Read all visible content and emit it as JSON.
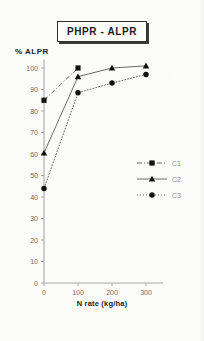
{
  "figure": {
    "background_color": "#fbfbfa",
    "title_box_border_color": "#2f2f2f"
  },
  "chart_data": {
    "type": "line",
    "title": "PHPR - ALPR",
    "xlabel": "N rate (kg/ha)",
    "ylabel": "% ALPR",
    "x": [
      0,
      100,
      200,
      300
    ],
    "xlim": [
      0,
      330
    ],
    "ylim": [
      0,
      105
    ],
    "xticks": [
      0,
      100,
      200,
      300
    ],
    "xtick_labels": [
      "0",
      "100",
      "200",
      "300"
    ],
    "yticks": [
      0,
      10,
      20,
      30,
      40,
      50,
      60,
      70,
      80,
      90,
      100
    ],
    "ytick_labels": [
      "0",
      "10",
      "20",
      "30",
      "40",
      "50",
      "60",
      "70",
      "80",
      "90",
      "100"
    ],
    "grid": false,
    "legend_position": "center-right",
    "series": [
      {
        "name": "C1",
        "marker": "square",
        "linestyle": "dash-dot",
        "x": [
          0,
          100
        ],
        "values": [
          85,
          100
        ]
      },
      {
        "name": "C2",
        "marker": "triangle",
        "linestyle": "solid",
        "x": [
          0,
          100,
          200,
          300
        ],
        "values": [
          60.5,
          96,
          100,
          101
        ]
      },
      {
        "name": "C3",
        "marker": "circle",
        "linestyle": "dotted",
        "x": [
          0,
          100,
          200,
          300
        ],
        "values": [
          44,
          88.5,
          93,
          97
        ]
      }
    ]
  }
}
